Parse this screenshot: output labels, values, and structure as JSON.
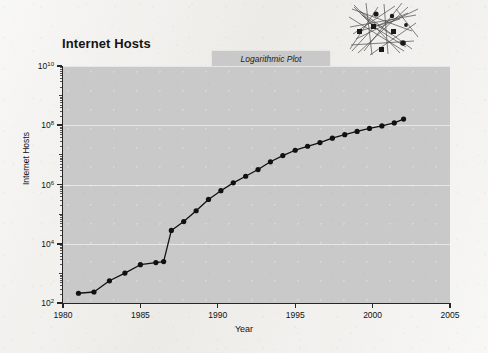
{
  "figure": {
    "title": "Internet Hosts",
    "plot_type_label": "Logarithmic Plot",
    "decoration": "network-graph-sketch",
    "background_color": "#f2f1ee",
    "plot_background_color": "#c9c9c9",
    "series_color": "#111111"
  },
  "chart_data": {
    "type": "line",
    "title": "Internet Hosts",
    "subtitle": "Logarithmic Plot",
    "xlabel": "Year",
    "ylabel": "Internet Hosts",
    "xlim": [
      1980,
      2005
    ],
    "ylim": [
      100,
      10000000000
    ],
    "yscale": "log",
    "xscale": "linear",
    "grid": true,
    "legend": "none",
    "x_ticks": [
      1980,
      1985,
      1990,
      1995,
      2000,
      2005
    ],
    "x_tick_labels": [
      "1980",
      "1985",
      "1990",
      "1995",
      "2000",
      "2005"
    ],
    "y_ticks": [
      100,
      10000,
      1000000,
      100000000,
      10000000000
    ],
    "y_tick_labels": [
      "10²",
      "10⁴",
      "10⁶",
      "10⁸",
      "10¹⁰"
    ],
    "y_tick_exponents": [
      2,
      4,
      6,
      8,
      10
    ],
    "marker": "filled-circle",
    "x": [
      1981.0,
      1982.0,
      1983.0,
      1984.0,
      1985.0,
      1986.0,
      1986.5,
      1987.0,
      1987.8,
      1988.6,
      1989.4,
      1990.2,
      1991.0,
      1991.8,
      1992.6,
      1993.4,
      1994.2,
      1995.0,
      1995.8,
      1996.6,
      1997.4,
      1998.2,
      1999.0,
      1999.8,
      2000.6,
      2001.4,
      2002.0
    ],
    "y": [
      213,
      235,
      562,
      1024,
      1961,
      2308,
      2500,
      28174,
      56000,
      130000,
      313000,
      617000,
      1136000,
      1900000,
      3200000,
      5846000,
      9472000,
      14352000,
      19540000,
      26053000,
      36739000,
      48000000,
      62000000,
      78000000,
      95000000,
      120000000,
      162128000
    ],
    "values_note": "Number of Internet hosts, logarithmic vertical scale",
    "annotations": []
  }
}
